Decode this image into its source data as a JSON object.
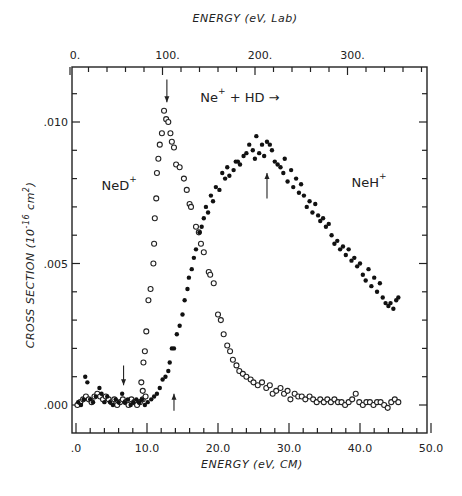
{
  "chart_data": {
    "type": "scatter",
    "xlabel": "ENERGY (eV, CM)",
    "x2label": "ENERGY (eV, Lab)",
    "ylabel": "CROSS SECTION (10^-16 cm^2)",
    "xlim": [
      0,
      50
    ],
    "ylim": [
      -0.0008,
      0.0118
    ],
    "x_ticks": [
      0,
      10,
      20,
      30,
      40,
      50
    ],
    "x_tick_labels": [
      ".0",
      "10.0",
      "20.0",
      "30.0",
      "40.0",
      "50.0"
    ],
    "x2_ticks_lab": [
      0,
      100,
      200,
      300
    ],
    "x2_tick_labels": [
      "0.",
      "100.",
      "200.",
      "300."
    ],
    "lab_to_cm_factor": 0.1304,
    "y_ticks": [
      0.0,
      0.005,
      0.01
    ],
    "y_tick_labels": [
      ".000",
      ".005",
      ".010"
    ],
    "grid": false,
    "legend": null,
    "annotations": [
      {
        "text": "NeD",
        "sup": "+",
        "x": 3.6,
        "y": 0.0076
      },
      {
        "text": "NeH",
        "sup": "+",
        "x": 38.8,
        "y": 0.0077
      },
      {
        "text": "Ne",
        "sup": "+",
        "rest": " + HD →",
        "x": 17.5,
        "y": 0.0107
      }
    ],
    "arrows": [
      {
        "direction": "down",
        "x": 12.8,
        "y_from": 0.0115,
        "y_to": 0.0107
      },
      {
        "direction": "down",
        "x": 6.7,
        "y_from": 0.0014,
        "y_to": 0.0007
      },
      {
        "direction": "up",
        "x": 13.8,
        "y_from": -0.0002,
        "y_to": 0.0004
      },
      {
        "direction": "up",
        "x": 26.9,
        "y_from": 0.0073,
        "y_to": 0.0082
      }
    ],
    "series": [
      {
        "name": "NeD+",
        "marker": "open-circle",
        "points": [
          [
            0.2,
            0.0
          ],
          [
            0.6,
            0.0001
          ],
          [
            1.0,
            0.0002
          ],
          [
            1.4,
            0.0003
          ],
          [
            1.8,
            0.0002
          ],
          [
            2.2,
            0.0001
          ],
          [
            2.6,
            0.0003
          ],
          [
            3.0,
            0.0004
          ],
          [
            3.4,
            0.0003
          ],
          [
            3.8,
            0.0002
          ],
          [
            4.2,
            0.0003
          ],
          [
            4.6,
            0.0002
          ],
          [
            5.0,
            0.0001
          ],
          [
            5.4,
            0.0002
          ],
          [
            5.8,
            0.0
          ],
          [
            6.2,
            0.0001
          ],
          [
            6.6,
            0.0002
          ],
          [
            7.0,
            0.0001
          ],
          [
            7.4,
            0.0
          ],
          [
            7.8,
            0.0002
          ],
          [
            8.2,
            0.0001
          ],
          [
            8.6,
            0.0
          ],
          [
            9.0,
            0.0001
          ],
          [
            9.4,
            0.0002
          ],
          [
            9.8,
            0.0003
          ],
          [
            9.2,
            0.0008
          ],
          [
            9.4,
            0.0005
          ],
          [
            9.5,
            0.0015
          ],
          [
            9.7,
            0.0019
          ],
          [
            9.9,
            0.0026
          ],
          [
            10.2,
            0.0037
          ],
          [
            10.5,
            0.0041
          ],
          [
            10.9,
            0.005
          ],
          [
            11.0,
            0.0057
          ],
          [
            11.1,
            0.0066
          ],
          [
            11.3,
            0.0073
          ],
          [
            11.4,
            0.0082
          ],
          [
            11.6,
            0.0087
          ],
          [
            11.8,
            0.0092
          ],
          [
            12.1,
            0.0096
          ],
          [
            12.4,
            0.0104
          ],
          [
            12.7,
            0.0101
          ],
          [
            13.0,
            0.01
          ],
          [
            13.3,
            0.0096
          ],
          [
            13.5,
            0.0093
          ],
          [
            13.8,
            0.0091
          ],
          [
            14.1,
            0.0085
          ],
          [
            14.6,
            0.0084
          ],
          [
            15.2,
            0.008
          ],
          [
            15.6,
            0.0076
          ],
          [
            16.0,
            0.0071
          ],
          [
            16.2,
            0.007
          ],
          [
            16.9,
            0.0063
          ],
          [
            17.3,
            0.0061
          ],
          [
            17.6,
            0.0057
          ],
          [
            18.0,
            0.0054
          ],
          [
            18.7,
            0.0047
          ],
          [
            18.9,
            0.0046
          ],
          [
            19.4,
            0.0043
          ],
          [
            20.0,
            0.0032
          ],
          [
            20.4,
            0.003
          ],
          [
            20.8,
            0.0025
          ],
          [
            21.3,
            0.0021
          ],
          [
            21.7,
            0.0019
          ],
          [
            22.1,
            0.0016
          ],
          [
            22.6,
            0.0014
          ],
          [
            23.0,
            0.0012
          ],
          [
            23.5,
            0.0011
          ],
          [
            24.0,
            0.001
          ],
          [
            24.6,
            0.0009
          ],
          [
            25.0,
            0.0008
          ],
          [
            25.6,
            0.0007
          ],
          [
            26.2,
            0.0008
          ],
          [
            26.8,
            0.0006
          ],
          [
            27.3,
            0.0007
          ],
          [
            27.7,
            0.0004
          ],
          [
            28.2,
            0.0005
          ],
          [
            28.8,
            0.0006
          ],
          [
            29.3,
            0.0004
          ],
          [
            29.8,
            0.0005
          ],
          [
            30.2,
            0.0002
          ],
          [
            30.8,
            0.0004
          ],
          [
            31.3,
            0.0003
          ],
          [
            31.8,
            0.0003
          ],
          [
            32.3,
            0.0002
          ],
          [
            32.9,
            0.0003
          ],
          [
            33.4,
            0.0002
          ],
          [
            33.9,
            0.0001
          ],
          [
            34.4,
            0.0002
          ],
          [
            34.9,
            0.0001
          ],
          [
            35.4,
            0.0002
          ],
          [
            35.9,
            0.0001
          ],
          [
            36.4,
            0.0002
          ],
          [
            36.9,
            0.0001
          ],
          [
            37.4,
            0.0001
          ],
          [
            37.9,
            0.0
          ],
          [
            38.4,
            0.0001
          ],
          [
            38.9,
            0.0002
          ],
          [
            39.4,
            0.0004
          ],
          [
            39.9,
            0.0001
          ],
          [
            40.4,
            0.0
          ],
          [
            40.9,
            0.0001
          ],
          [
            41.4,
            0.0001
          ],
          [
            41.9,
            0.0
          ],
          [
            42.4,
            0.0001
          ],
          [
            42.9,
            0.0001
          ],
          [
            43.4,
            0.0
          ],
          [
            43.9,
            -0.0001
          ],
          [
            44.4,
            0.0001
          ],
          [
            44.9,
            0.0002
          ],
          [
            45.4,
            0.0001
          ]
        ]
      },
      {
        "name": "NeH+",
        "marker": "filled-circle",
        "points": [
          [
            0.3,
            0.0001
          ],
          [
            0.7,
            0.0
          ],
          [
            1.1,
            0.0002
          ],
          [
            1.3,
            0.001
          ],
          [
            1.6,
            0.0008
          ],
          [
            2.0,
            0.0002
          ],
          [
            2.4,
            0.0001
          ],
          [
            2.8,
            0.0003
          ],
          [
            3.3,
            0.0006
          ],
          [
            3.6,
            0.0004
          ],
          [
            4.0,
            0.0001
          ],
          [
            4.4,
            0.0003
          ],
          [
            4.8,
            0.0001
          ],
          [
            5.2,
            0.0
          ],
          [
            5.6,
            0.0002
          ],
          [
            6.0,
            0.0001
          ],
          [
            6.5,
            0.0004
          ],
          [
            6.9,
            0.0001
          ],
          [
            7.3,
            0.0002
          ],
          [
            7.7,
            0.0
          ],
          [
            8.1,
            0.0001
          ],
          [
            8.5,
            0.0002
          ],
          [
            8.9,
            0.0001
          ],
          [
            9.3,
            0.0002
          ],
          [
            9.7,
            0.0
          ],
          [
            10.1,
            0.0001
          ],
          [
            10.6,
            0.0002
          ],
          [
            11.0,
            0.0003
          ],
          [
            11.4,
            0.0004
          ],
          [
            11.8,
            0.0006
          ],
          [
            12.2,
            0.0009
          ],
          [
            12.6,
            0.001
          ],
          [
            13.0,
            0.0012
          ],
          [
            13.2,
            0.0015
          ],
          [
            13.5,
            0.002
          ],
          [
            13.8,
            0.002
          ],
          [
            14.2,
            0.0025
          ],
          [
            14.6,
            0.0028
          ],
          [
            15.0,
            0.0032
          ],
          [
            15.3,
            0.0037
          ],
          [
            15.7,
            0.0041
          ],
          [
            15.9,
            0.0045
          ],
          [
            16.3,
            0.0048
          ],
          [
            16.6,
            0.0052
          ],
          [
            16.9,
            0.0055
          ],
          [
            17.4,
            0.0061
          ],
          [
            17.7,
            0.0063
          ],
          [
            18.0,
            0.0066
          ],
          [
            18.3,
            0.007
          ],
          [
            18.6,
            0.0068
          ],
          [
            19.0,
            0.0074
          ],
          [
            19.3,
            0.0072
          ],
          [
            19.7,
            0.0077
          ],
          [
            20.2,
            0.0076
          ],
          [
            20.6,
            0.0082
          ],
          [
            21.0,
            0.008
          ],
          [
            21.3,
            0.0084
          ],
          [
            21.6,
            0.0081
          ],
          [
            22.2,
            0.0083
          ],
          [
            22.5,
            0.0086
          ],
          [
            22.8,
            0.0086
          ],
          [
            23.1,
            0.0085
          ],
          [
            23.6,
            0.0088
          ],
          [
            24.0,
            0.0089
          ],
          [
            24.4,
            0.0092
          ],
          [
            24.9,
            0.009
          ],
          [
            25.2,
            0.0087
          ],
          [
            25.4,
            0.0095
          ],
          [
            25.8,
            0.0089
          ],
          [
            26.2,
            0.0092
          ],
          [
            26.5,
            0.0088
          ],
          [
            26.9,
            0.0093
          ],
          [
            27.3,
            0.0092
          ],
          [
            27.6,
            0.009
          ],
          [
            28.0,
            0.0086
          ],
          [
            28.4,
            0.0085
          ],
          [
            28.8,
            0.0084
          ],
          [
            29.2,
            0.0082
          ],
          [
            29.4,
            0.0087
          ],
          [
            29.8,
            0.0079
          ],
          [
            30.3,
            0.0083
          ],
          [
            30.6,
            0.0077
          ],
          [
            31.0,
            0.008
          ],
          [
            31.4,
            0.0075
          ],
          [
            31.7,
            0.0078
          ],
          [
            32.1,
            0.0074
          ],
          [
            32.5,
            0.007
          ],
          [
            32.9,
            0.0072
          ],
          [
            33.3,
            0.0068
          ],
          [
            33.7,
            0.0071
          ],
          [
            34.1,
            0.0067
          ],
          [
            34.4,
            0.0065
          ],
          [
            34.8,
            0.0066
          ],
          [
            35.2,
            0.0063
          ],
          [
            35.6,
            0.0064
          ],
          [
            36.0,
            0.006
          ],
          [
            36.4,
            0.0057
          ],
          [
            36.8,
            0.0058
          ],
          [
            37.2,
            0.0055
          ],
          [
            37.6,
            0.0056
          ],
          [
            38.0,
            0.0053
          ],
          [
            38.4,
            0.0055
          ],
          [
            38.8,
            0.0051
          ],
          [
            39.2,
            0.0052
          ],
          [
            39.6,
            0.0049
          ],
          [
            40.0,
            0.005
          ],
          [
            40.4,
            0.0046
          ],
          [
            40.8,
            0.0044
          ],
          [
            41.2,
            0.0048
          ],
          [
            41.6,
            0.0042
          ],
          [
            42.0,
            0.0045
          ],
          [
            42.4,
            0.004
          ],
          [
            42.8,
            0.0043
          ],
          [
            43.2,
            0.0038
          ],
          [
            43.6,
            0.0036
          ],
          [
            44.0,
            0.0035
          ],
          [
            44.3,
            0.0036
          ],
          [
            44.7,
            0.0034
          ],
          [
            45.1,
            0.0037
          ],
          [
            45.4,
            0.0038
          ]
        ]
      }
    ]
  }
}
